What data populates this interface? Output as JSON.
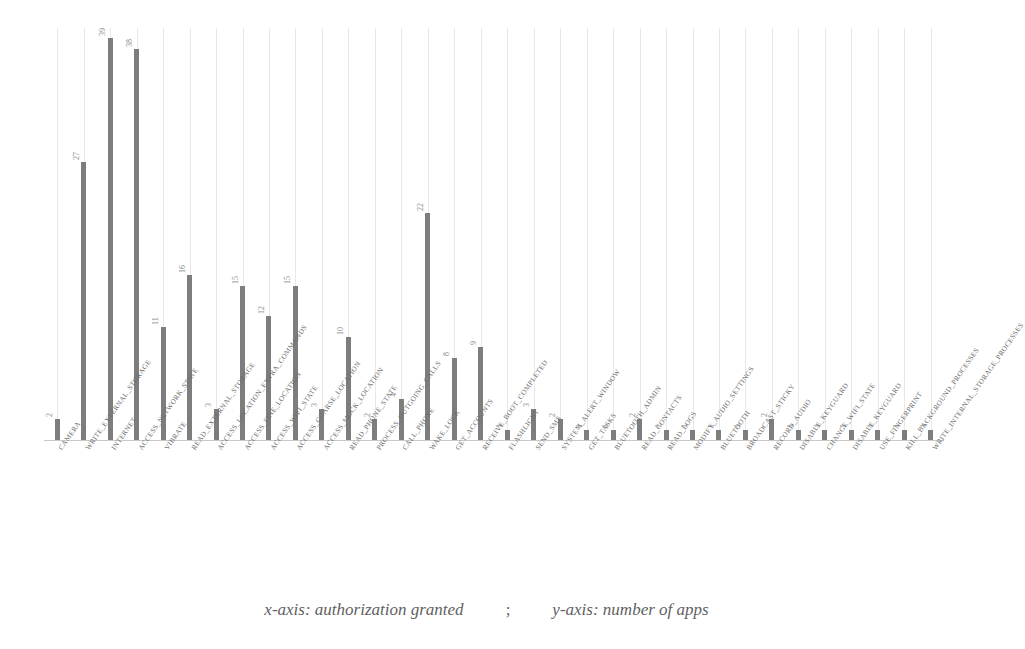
{
  "caption": {
    "x_part": "x-axis: authorization granted",
    "separator": ";",
    "y_part": "y-axis: number of apps"
  },
  "style": {
    "bar_color": "#7d7d7d",
    "gridline_color": "#e8e8e8",
    "text_color": "#6d6d6d",
    "background": "#ffffff"
  },
  "chart_data": {
    "type": "bar",
    "title": "",
    "xlabel": "authorization granted",
    "ylabel": "number of apps",
    "ylim": [
      0,
      40
    ],
    "grid": "vertical",
    "legend": "none",
    "orientation": "vertical",
    "value_labels": true,
    "categories": [
      "CAMERA",
      "WRITE_EXTERNAL_STORAGE",
      "INTERNET",
      "ACCESS_NETWORK_STATE",
      "VIBRATE",
      "READ_EXTERNAL_STORAGE",
      "ACCESS_LOCATION_EXTRA_COMMANDS",
      "ACCESS_FINE_LOCATION",
      "ACCESS_WIFI_STATE",
      "ACCESS_COARSE_LOCATION",
      "ACCESS_MOCK_LOCATION",
      "READ_PHONE_STATE",
      "PROCESS_OUTGOING_CALLS",
      "CALL_PHONE",
      "WAKE_LOCK",
      "GET_ACCOUNTS",
      "RECEIVE_BOOT_COMPLETED",
      "FLASHLIGHT",
      "SEND_SMS",
      "SYSTEM_ALERT_WINDOW",
      "GET_TASKS",
      "BLUETOOTH_ADMIN",
      "READ_CONTACTS",
      "READ_LOGS",
      "MODIFY_AUDIO_SETTINGS",
      "BLUETOOTH",
      "BROADCAST_STICKY",
      "RECORD_AUDIO",
      "DISABLE_KEYGUARD",
      "CHANGE_WIFI_STATE",
      "DISABLE_KEYGUARD",
      "USE_FINGERPRINT",
      "KILL_BACKGROUND_PROCESSES",
      "WRITE_INTERNAL_STORAGE_PROCESSES"
    ],
    "values": [
      2,
      27,
      39,
      38,
      11,
      16,
      3,
      15,
      12,
      15,
      3,
      10,
      2,
      4,
      22,
      8,
      9,
      1,
      3,
      2,
      1,
      1,
      2,
      1,
      1,
      1,
      1,
      2,
      1,
      1,
      1,
      1,
      1,
      1
    ]
  }
}
